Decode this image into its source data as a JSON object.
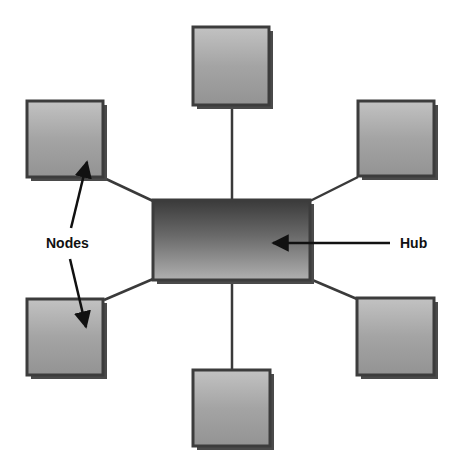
{
  "diagram": {
    "type": "star-topology",
    "colors": {
      "hub_top": "#3a3a3a",
      "hub_bottom": "#a8a8a8",
      "node_top": "#8e8e8e",
      "node_bottom": "#c4c4c4",
      "border": "#3c3c3c",
      "shadow": "#4a4a4a",
      "line": "#3a3a3a",
      "arrow": "#111111"
    },
    "hub": {
      "x": 153,
      "y": 200,
      "w": 157,
      "h": 80
    },
    "nodes": [
      {
        "id": "node-top",
        "x": 193,
        "y": 27,
        "w": 76,
        "h": 78
      },
      {
        "id": "node-top-left",
        "x": 27,
        "y": 101,
        "w": 76,
        "h": 76
      },
      {
        "id": "node-top-right",
        "x": 358,
        "y": 101,
        "w": 76,
        "h": 75
      },
      {
        "id": "node-bottom-left",
        "x": 27,
        "y": 299,
        "w": 76,
        "h": 76
      },
      {
        "id": "node-bottom-right",
        "x": 357,
        "y": 298,
        "w": 77,
        "h": 77
      },
      {
        "id": "node-bottom",
        "x": 193,
        "y": 370,
        "w": 77,
        "h": 76
      }
    ],
    "labels": {
      "nodes": "Nodes",
      "hub": "Hub"
    }
  }
}
